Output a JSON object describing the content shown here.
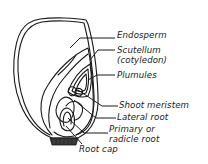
{
  "diagram": {
    "colors": {
      "line": "#1a1a1a",
      "background": "#ffffff",
      "root_base_fill": "#333333"
    },
    "labels": [
      {
        "id": "endosperm",
        "text": "Endosperm"
      },
      {
        "id": "scutellum",
        "text": "Scutellum"
      },
      {
        "id": "cotyledon",
        "text": "(cotyledon)"
      },
      {
        "id": "plumules",
        "text": "Plumules"
      },
      {
        "id": "shoot_meristem",
        "text": "Shoot meristem"
      },
      {
        "id": "lateral_root",
        "text": "Lateral root"
      },
      {
        "id": "primary_root_1",
        "text": "Primary or"
      },
      {
        "id": "primary_root_2",
        "text": "radicle root"
      },
      {
        "id": "root_cap",
        "text": "Root cap"
      }
    ]
  }
}
